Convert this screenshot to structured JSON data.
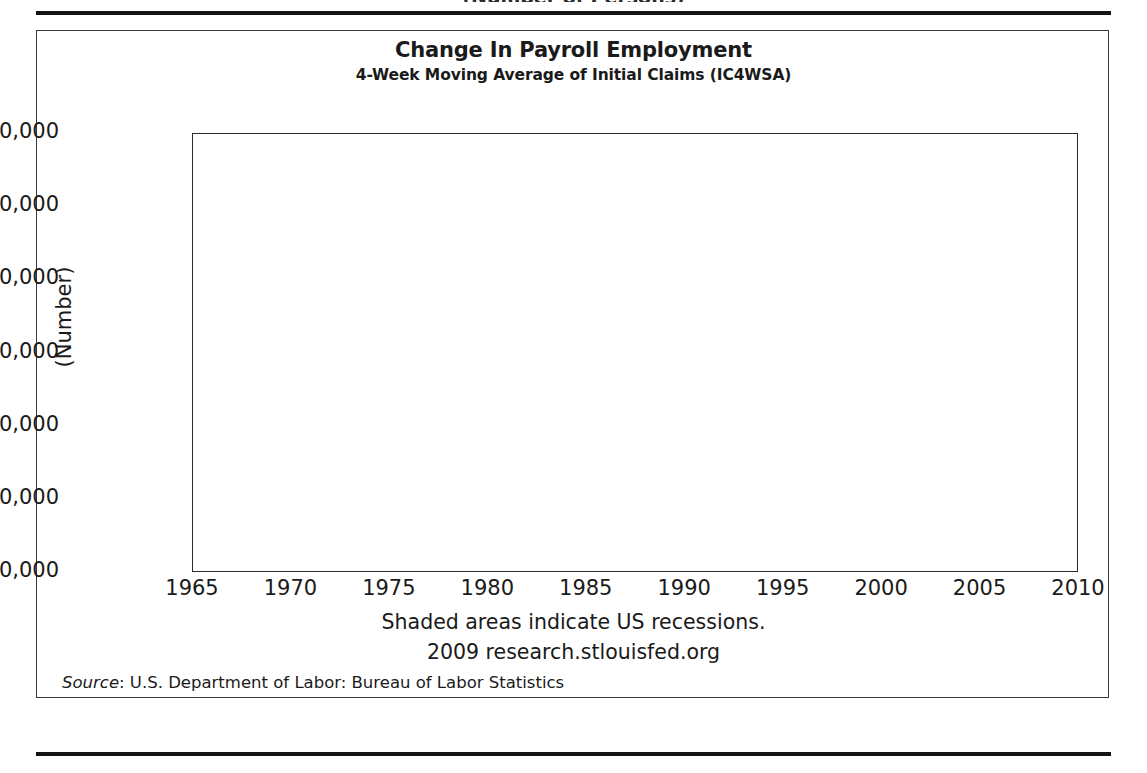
{
  "page": {
    "top_clipped_caption": "(Number of Persons)"
  },
  "figure": {
    "title": "Change In Payroll Employment",
    "subtitle": "4-Week Moving Average of Initial Claims (IC4WSA)",
    "footnote_recessions": "Shaded areas indicate US recessions.",
    "footnote_source_site": "2009 research.stlouisfed.org",
    "source_prefix": "Source",
    "source_text": ": U.S. Department of Labor: Bureau of Labor Statistics",
    "colors": {
      "line": "#111111",
      "recession_band": "#c9c9c9",
      "gridline": "#9a9a9a",
      "frame": "#2b2b2b",
      "text": "#1a1a1a"
    }
  },
  "chart_data": {
    "type": "line",
    "title": "Change In Payroll Employment",
    "subtitle": "4-Week Moving Average of Initial Claims (IC4WSA)",
    "xlabel": "",
    "ylabel": "(Number)",
    "xlim": [
      1965,
      2010
    ],
    "ylim": [
      100000,
      700000
    ],
    "xticks": [
      1965,
      1970,
      1975,
      1980,
      1985,
      1990,
      1995,
      2000,
      2005,
      2010
    ],
    "xtick_labels": [
      "1965",
      "1970",
      "1975",
      "1980",
      "1985",
      "1990",
      "1995",
      "2000",
      "2005",
      "2010"
    ],
    "yticks": [
      100000,
      200000,
      300000,
      400000,
      500000,
      600000,
      700000
    ],
    "ytick_labels": [
      "100,000",
      "200,000",
      "300,000",
      "400,000",
      "500,000",
      "600,000",
      "700,000"
    ],
    "grid": true,
    "grid_axis": "y",
    "legend": false,
    "annotations": [
      "Shaded areas indicate US recessions.",
      "2009 research.stlouisfed.org"
    ],
    "recession_bands": [
      {
        "start": 1969.95,
        "end": 1970.92
      },
      {
        "start": 1973.92,
        "end": 1975.18
      },
      {
        "start": 1980.08,
        "end": 1980.58
      },
      {
        "start": 1981.58,
        "end": 1982.92
      },
      {
        "start": 1990.58,
        "end": 1991.25
      },
      {
        "start": 2001.25,
        "end": 2001.92
      },
      {
        "start": 2007.92,
        "end": 2009.75
      }
    ],
    "series": [
      {
        "name": "4-Week Moving Average of Initial Claims (IC4WSA)",
        "units": "Number",
        "x": [
          1967.1,
          1967.3,
          1967.5,
          1967.7,
          1967.9,
          1968.1,
          1968.3,
          1968.5,
          1968.7,
          1968.9,
          1969.1,
          1969.3,
          1969.5,
          1969.7,
          1969.9,
          1970.1,
          1970.3,
          1970.5,
          1970.7,
          1970.9,
          1971.1,
          1971.3,
          1971.5,
          1971.7,
          1971.9,
          1972.1,
          1972.3,
          1972.5,
          1972.7,
          1972.9,
          1973.1,
          1973.3,
          1973.5,
          1973.7,
          1973.9,
          1974.1,
          1974.3,
          1974.5,
          1974.7,
          1974.9,
          1975.05,
          1975.2,
          1975.4,
          1975.6,
          1975.8,
          1976.0,
          1976.2,
          1976.4,
          1976.6,
          1976.8,
          1977.0,
          1977.2,
          1977.4,
          1977.6,
          1977.8,
          1978.0,
          1978.2,
          1978.4,
          1978.6,
          1978.8,
          1979.0,
          1979.2,
          1979.4,
          1979.6,
          1979.8,
          1980.0,
          1980.15,
          1980.3,
          1980.45,
          1980.6,
          1980.75,
          1980.9,
          1981.05,
          1981.25,
          1981.45,
          1981.65,
          1981.8,
          1981.95,
          1982.1,
          1982.3,
          1982.5,
          1982.7,
          1982.85,
          1982.95,
          1983.1,
          1983.3,
          1983.5,
          1983.7,
          1983.9,
          1984.1,
          1984.3,
          1984.5,
          1984.7,
          1984.9,
          1985.1,
          1985.3,
          1985.5,
          1985.7,
          1985.9,
          1986.1,
          1986.3,
          1986.5,
          1986.7,
          1986.9,
          1987.1,
          1987.3,
          1987.5,
          1987.7,
          1987.9,
          1988.1,
          1988.3,
          1988.5,
          1988.7,
          1988.9,
          1989.1,
          1989.3,
          1989.5,
          1989.7,
          1989.9,
          1990.1,
          1990.3,
          1990.5,
          1990.7,
          1990.9,
          1991.05,
          1991.2,
          1991.35,
          1991.5,
          1991.7,
          1991.9,
          1992.1,
          1992.3,
          1992.5,
          1992.7,
          1992.9,
          1993.1,
          1993.3,
          1993.5,
          1993.7,
          1993.9,
          1994.1,
          1994.3,
          1994.5,
          1994.7,
          1994.9,
          1995.1,
          1995.3,
          1995.5,
          1995.7,
          1995.9,
          1996.1,
          1996.3,
          1996.5,
          1996.7,
          1996.9,
          1997.1,
          1997.3,
          1997.5,
          1997.7,
          1997.9,
          1998.1,
          1998.3,
          1998.5,
          1998.7,
          1998.9,
          1999.1,
          1999.3,
          1999.5,
          1999.7,
          1999.9,
          2000.1,
          2000.3,
          2000.5,
          2000.7,
          2000.9,
          2001.05,
          2001.2,
          2001.35,
          2001.5,
          2001.65,
          2001.8,
          2001.95,
          2002.1,
          2002.3,
          2002.5,
          2002.7,
          2002.9,
          2003.1,
          2003.3,
          2003.5,
          2003.7,
          2003.9,
          2004.1,
          2004.3,
          2004.5,
          2004.7,
          2004.9,
          2005.1,
          2005.3,
          2005.5,
          2005.7,
          2005.85,
          2005.95,
          2006.1,
          2006.3,
          2006.5,
          2006.7,
          2006.9,
          2007.1,
          2007.3,
          2007.5,
          2007.7,
          2007.9,
          2008.1,
          2008.3,
          2008.5,
          2008.7,
          2008.9,
          2009.05,
          2009.2,
          2009.35,
          2009.5,
          2009.65,
          2009.8
        ],
        "y": [
          215000,
          262000,
          232000,
          228000,
          213000,
          208000,
          196000,
          212000,
          195000,
          186000,
          199000,
          188000,
          192000,
          202000,
          186000,
          196000,
          212000,
          248000,
          300000,
          340000,
          292000,
          314000,
          298000,
          288000,
          291000,
          325000,
          320000,
          296000,
          312000,
          268000,
          252000,
          238000,
          228000,
          238000,
          246000,
          262000,
          306000,
          348000,
          420000,
          492000,
          540000,
          558000,
          528000,
          456000,
          432000,
          424000,
          452000,
          418000,
          432000,
          472000,
          398000,
          408000,
          372000,
          356000,
          346000,
          368000,
          336000,
          352000,
          332000,
          322000,
          344000,
          368000,
          388000,
          392000,
          412000,
          458000,
          548000,
          628000,
          528000,
          462000,
          428000,
          412000,
          424000,
          408000,
          418000,
          432000,
          470000,
          506000,
          538000,
          592000,
          624000,
          672000,
          616000,
          556000,
          492000,
          462000,
          438000,
          452000,
          398000,
          372000,
          388000,
          364000,
          380000,
          398000,
          412000,
          416000,
          392000,
          378000,
          386000,
          366000,
          378000,
          342000,
          352000,
          338000,
          330000,
          318000,
          308000,
          302000,
          290000,
          288000,
          298000,
          292000,
          306000,
          312000,
          340000,
          348000,
          332000,
          348000,
          362000,
          384000,
          372000,
          406000,
          436000,
          452000,
          468000,
          502000,
          462000,
          472000,
          436000,
          448000,
          412000,
          372000,
          348000,
          356000,
          342000,
          356000,
          338000,
          348000,
          340000,
          352000,
          340000,
          328000,
          336000,
          342000,
          348000,
          352000,
          366000,
          378000,
          384000,
          362000,
          372000,
          358000,
          350000,
          366000,
          344000,
          338000,
          352000,
          330000,
          320000,
          314000,
          316000,
          324000,
          306000,
          312000,
          300000,
          308000,
          298000,
          292000,
          306000,
          288000,
          286000,
          296000,
          282000,
          274000,
          288000,
          296000,
          328000,
          352000,
          374000,
          398000,
          402000,
          440000,
          420000,
          408000,
          432000,
          392000,
          412000,
          428000,
          442000,
          424000,
          412000,
          398000,
          372000,
          352000,
          342000,
          336000,
          340000,
          328000,
          320000,
          330000,
          322000,
          312000,
          394000,
          318000,
          322000,
          316000,
          326000,
          318000,
          330000,
          322000,
          326000,
          338000,
          346000,
          368000,
          386000,
          406000,
          452000,
          506000,
          562000,
          614000,
          650000,
          656000,
          598000,
          548000
        ]
      }
    ]
  }
}
